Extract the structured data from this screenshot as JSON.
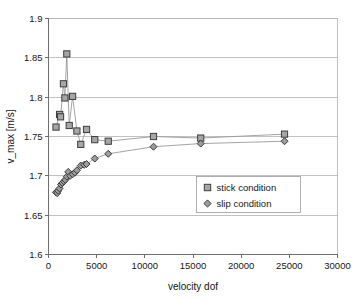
{
  "chart_data": {
    "type": "line",
    "title": "",
    "subtitle": "",
    "xlabel": "velocity dof",
    "ylabel": "v_max [m/s]",
    "xlim": [
      0,
      30000
    ],
    "ylim": [
      1.6,
      1.9
    ],
    "xticks": [
      0,
      5000,
      10000,
      15000,
      20000,
      25000,
      30000
    ],
    "xtick_labels": [
      "0",
      "5000",
      "10000",
      "15000",
      "20000",
      "25000",
      "30000"
    ],
    "yticks": [
      1.6,
      1.65,
      1.7,
      1.75,
      1.8,
      1.85,
      1.9
    ],
    "ytick_labels": [
      "1.6",
      "1.65",
      "1.7",
      "1.75",
      "1.8",
      "1.85",
      "1.9"
    ],
    "grid": "horizontal",
    "legend_position": "inside-right-lower",
    "series": [
      {
        "name": "stick condition",
        "marker": "square",
        "marker_color": "#a6a6a6",
        "marker_edge_color": "#3d3d3d",
        "line_color": "#9a9a9a",
        "points": [
          [
            780,
            1.762
          ],
          [
            1150,
            1.778
          ],
          [
            1250,
            1.775
          ],
          [
            1550,
            1.817
          ],
          [
            1700,
            1.799
          ],
          [
            1900,
            1.855
          ],
          [
            2150,
            1.764
          ],
          [
            2500,
            1.801
          ],
          [
            2950,
            1.757
          ],
          [
            3350,
            1.74
          ],
          [
            3950,
            1.759
          ],
          [
            4800,
            1.746
          ],
          [
            6200,
            1.744
          ],
          [
            10900,
            1.75
          ],
          [
            15800,
            1.748
          ],
          [
            24500,
            1.753
          ]
        ]
      },
      {
        "name": "slip condition",
        "marker": "diamond",
        "marker_color": "#9c9c9c",
        "marker_edge_color": "#3a3a3a",
        "line_color": "#9a9a9a",
        "points": [
          [
            780,
            1.679
          ],
          [
            900,
            1.678
          ],
          [
            1000,
            1.681
          ],
          [
            1150,
            1.684
          ],
          [
            1300,
            1.689
          ],
          [
            1450,
            1.691
          ],
          [
            1600,
            1.693
          ],
          [
            1750,
            1.695
          ],
          [
            1900,
            1.699
          ],
          [
            2050,
            1.705
          ],
          [
            2250,
            1.7
          ],
          [
            2500,
            1.702
          ],
          [
            2750,
            1.704
          ],
          [
            2950,
            1.707
          ],
          [
            3350,
            1.713
          ],
          [
            3700,
            1.714
          ],
          [
            3950,
            1.715
          ],
          [
            4800,
            1.722
          ],
          [
            6200,
            1.728
          ],
          [
            10900,
            1.737
          ],
          [
            15800,
            1.741
          ],
          [
            24500,
            1.744
          ]
        ]
      }
    ]
  },
  "legend": {
    "entries": [
      {
        "label": "stick condition",
        "marker": "square-marker-icon"
      },
      {
        "label": "slip condition",
        "marker": "diamond-marker-icon"
      }
    ]
  },
  "colors": {
    "grid": "#b3b3b3",
    "axis": "#6e6e6e",
    "series_line": "#9a9a9a",
    "text": "#161616",
    "background": "#ffffff"
  }
}
